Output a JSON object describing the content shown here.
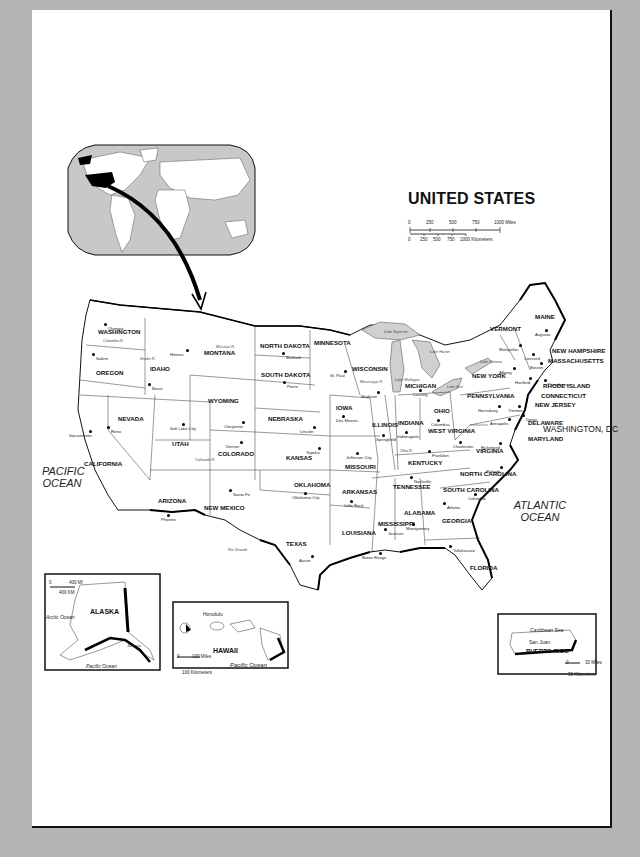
{
  "map": {
    "title": "UNITED STATES",
    "scale": {
      "miles_ticks": [
        "0",
        "250",
        "500",
        "750",
        "1000 Miles"
      ],
      "km_ticks": [
        "0",
        "250",
        "500",
        "750",
        "1000 Kilometers"
      ]
    },
    "oceans": {
      "pacific": "PACIFIC OCEAN",
      "atlantic": "ATLANTIC OCEAN"
    },
    "district": "WASHINGTON, DC",
    "states": [
      {
        "name": "WASHINGTON",
        "x": 98,
        "y": 329
      },
      {
        "name": "OREGON",
        "x": 96,
        "y": 370
      },
      {
        "name": "IDAHO",
        "x": 150,
        "y": 366
      },
      {
        "name": "MONTANA",
        "x": 204,
        "y": 350
      },
      {
        "name": "WYOMING",
        "x": 208,
        "y": 398
      },
      {
        "name": "NEVADA",
        "x": 118,
        "y": 416
      },
      {
        "name": "UTAH",
        "x": 172,
        "y": 441
      },
      {
        "name": "CALIFORNIA",
        "x": 84,
        "y": 461
      },
      {
        "name": "COLORADO",
        "x": 218,
        "y": 451
      },
      {
        "name": "ARIZONA",
        "x": 158,
        "y": 498
      },
      {
        "name": "NEW MEXICO",
        "x": 204,
        "y": 505
      },
      {
        "name": "NORTH DAKOTA",
        "x": 260,
        "y": 343
      },
      {
        "name": "SOUTH DAKOTA",
        "x": 261,
        "y": 372
      },
      {
        "name": "NEBRASKA",
        "x": 268,
        "y": 416
      },
      {
        "name": "KANSAS",
        "x": 286,
        "y": 455
      },
      {
        "name": "OKLAHOMA",
        "x": 294,
        "y": 482
      },
      {
        "name": "TEXAS",
        "x": 286,
        "y": 541
      },
      {
        "name": "MINNESOTA",
        "x": 314,
        "y": 340
      },
      {
        "name": "IOWA",
        "x": 336,
        "y": 405
      },
      {
        "name": "MISSOURI",
        "x": 345,
        "y": 464
      },
      {
        "name": "ARKANSAS",
        "x": 342,
        "y": 489
      },
      {
        "name": "LOUISIANA",
        "x": 342,
        "y": 530
      },
      {
        "name": "WISCONSIN",
        "x": 352,
        "y": 366
      },
      {
        "name": "ILLINOIS",
        "x": 372,
        "y": 422
      },
      {
        "name": "MICHIGAN",
        "x": 405,
        "y": 383
      },
      {
        "name": "INDIANA",
        "x": 398,
        "y": 420
      },
      {
        "name": "OHIO",
        "x": 434,
        "y": 408
      },
      {
        "name": "KENTUCKY",
        "x": 408,
        "y": 460
      },
      {
        "name": "TENNESSEE",
        "x": 393,
        "y": 484
      },
      {
        "name": "MISSISSIPPI",
        "x": 378,
        "y": 521
      },
      {
        "name": "ALABAMA",
        "x": 404,
        "y": 510
      },
      {
        "name": "GEORGIA",
        "x": 442,
        "y": 518
      },
      {
        "name": "FLORIDA",
        "x": 470,
        "y": 565
      },
      {
        "name": "SOUTH CAROLINA",
        "x": 443,
        "y": 487
      },
      {
        "name": "NORTH CAROLINA",
        "x": 460,
        "y": 471
      },
      {
        "name": "VIRGINIA",
        "x": 476,
        "y": 448
      },
      {
        "name": "WEST VIRGINIA",
        "x": 428,
        "y": 428
      },
      {
        "name": "PENNSYLVANIA",
        "x": 467,
        "y": 393
      },
      {
        "name": "NEW YORK",
        "x": 472,
        "y": 373
      },
      {
        "name": "VERMONT",
        "x": 490,
        "y": 326
      },
      {
        "name": "MAINE",
        "x": 535,
        "y": 314
      },
      {
        "name": "NEW HAMPSHIRE",
        "x": 552,
        "y": 348
      },
      {
        "name": "MASSACHUSETTS",
        "x": 548,
        "y": 358
      },
      {
        "name": "RHODE ISLAND",
        "x": 543,
        "y": 383
      },
      {
        "name": "CONNECTICUT",
        "x": 541,
        "y": 393
      },
      {
        "name": "NEW JERSEY",
        "x": 535,
        "y": 402
      },
      {
        "name": "DELAWARE",
        "x": 528,
        "y": 420
      },
      {
        "name": "MARYLAND",
        "x": 528,
        "y": 436
      }
    ],
    "capitals": [
      {
        "name": "Olympia",
        "x": 104,
        "y": 323,
        "dx": 4
      },
      {
        "name": "Salem",
        "x": 92,
        "y": 353,
        "dx": 4
      },
      {
        "name": "Boise",
        "x": 148,
        "y": 383,
        "dx": 4
      },
      {
        "name": "Helena",
        "x": 186,
        "y": 349,
        "dx": -16
      },
      {
        "name": "Bismark",
        "x": 282,
        "y": 352,
        "dx": 4
      },
      {
        "name": "Pierre",
        "x": 283,
        "y": 381,
        "dx": 4
      },
      {
        "name": "Cheyenne",
        "x": 242,
        "y": 421,
        "dx": -18
      },
      {
        "name": "Sacramento",
        "x": 89,
        "y": 430,
        "dx": -20
      },
      {
        "name": "Reno",
        "x": 107,
        "y": 426,
        "dx": 4
      },
      {
        "name": "Salt Lake City",
        "x": 182,
        "y": 423,
        "dx": -12
      },
      {
        "name": "Denver",
        "x": 240,
        "y": 441,
        "dx": -14
      },
      {
        "name": "Santa Fe",
        "x": 229,
        "y": 489,
        "dx": 4
      },
      {
        "name": "Phoenix",
        "x": 167,
        "y": 514,
        "dx": -6
      },
      {
        "name": "Lincoln",
        "x": 313,
        "y": 426,
        "dx": -13
      },
      {
        "name": "Topeka",
        "x": 318,
        "y": 447,
        "dx": -12
      },
      {
        "name": "Oklahoma City",
        "x": 304,
        "y": 492,
        "dx": -12
      },
      {
        "name": "Austin",
        "x": 311,
        "y": 555,
        "dx": -12
      },
      {
        "name": "St. Paul",
        "x": 344,
        "y": 370,
        "dx": -14
      },
      {
        "name": "Des Moines",
        "x": 342,
        "y": 415,
        "dx": -6
      },
      {
        "name": "Jefferson City",
        "x": 356,
        "y": 452,
        "dx": -10
      },
      {
        "name": "Little Rock",
        "x": 350,
        "y": 500,
        "dx": -6
      },
      {
        "name": "Baton Rouge",
        "x": 379,
        "y": 552,
        "dx": -17
      },
      {
        "name": "Jackson",
        "x": 384,
        "y": 528,
        "dx": 0
      },
      {
        "name": "Madison",
        "x": 377,
        "y": 391,
        "dx": -16
      },
      {
        "name": "Lansing",
        "x": 419,
        "y": 389,
        "dx": -6
      },
      {
        "name": "Springfield",
        "x": 382,
        "y": 434,
        "dx": -6
      },
      {
        "name": "Indianapolis",
        "x": 405,
        "y": 431,
        "dx": -8
      },
      {
        "name": "Columbus",
        "x": 437,
        "y": 419,
        "dx": -6
      },
      {
        "name": "Frankfort",
        "x": 428,
        "y": 450,
        "dx": 4
      },
      {
        "name": "Nashville",
        "x": 410,
        "y": 476,
        "dx": 4
      },
      {
        "name": "Montgomery",
        "x": 412,
        "y": 523,
        "dx": -6
      },
      {
        "name": "Atlanta",
        "x": 443,
        "y": 502,
        "dx": 4
      },
      {
        "name": "Tallahassee",
        "x": 449,
        "y": 545,
        "dx": 4
      },
      {
        "name": "Columbia",
        "x": 474,
        "y": 493,
        "dx": -6
      },
      {
        "name": "Raleigh",
        "x": 500,
        "y": 466,
        "dx": -14
      },
      {
        "name": "Richmond",
        "x": 499,
        "y": 442,
        "dx": -18
      },
      {
        "name": "Charleston",
        "x": 459,
        "y": 441,
        "dx": -6
      },
      {
        "name": "Harrisburg",
        "x": 498,
        "y": 405,
        "dx": -20
      },
      {
        "name": "Trenton",
        "x": 518,
        "y": 405,
        "dx": -10
      },
      {
        "name": "Dover",
        "x": 522,
        "y": 414,
        "dx": 4
      },
      {
        "name": "Annapolis",
        "x": 508,
        "y": 418,
        "dx": -18
      },
      {
        "name": "Albany",
        "x": 513,
        "y": 367,
        "dx": -14
      },
      {
        "name": "Hartford",
        "x": 529,
        "y": 377,
        "dx": -14
      },
      {
        "name": "Providence",
        "x": 544,
        "y": 379,
        "dx": 4
      },
      {
        "name": "Boston",
        "x": 540,
        "y": 362,
        "dx": -10
      },
      {
        "name": "Concord",
        "x": 532,
        "y": 353,
        "dx": -8
      },
      {
        "name": "Montpelier",
        "x": 519,
        "y": 344,
        "dx": -20
      },
      {
        "name": "Augusta",
        "x": 545,
        "y": 329,
        "dx": -10
      }
    ],
    "rivers": [
      {
        "name": "Columbia R.",
        "x": 103,
        "y": 339
      },
      {
        "name": "Snake R.",
        "x": 140,
        "y": 357
      },
      {
        "name": "Missouri R.",
        "x": 216,
        "y": 345
      },
      {
        "name": "Mississippi R.",
        "x": 360,
        "y": 380
      },
      {
        "name": "Colorado R.",
        "x": 195,
        "y": 458
      },
      {
        "name": "Rio Grande",
        "x": 228,
        "y": 548
      },
      {
        "name": "Ohio R.",
        "x": 400,
        "y": 449
      }
    ],
    "lakes": [
      {
        "name": "Lake Superior",
        "x": 384,
        "y": 330
      },
      {
        "name": "Lake Michigan",
        "x": 395,
        "y": 378
      },
      {
        "name": "Lake Huron",
        "x": 430,
        "y": 350
      },
      {
        "name": "Lake Erie",
        "x": 447,
        "y": 385
      },
      {
        "name": "Lake Ontario",
        "x": 480,
        "y": 360
      }
    ]
  },
  "insets": {
    "alaska": {
      "title": "ALASKA",
      "capital": "Juneau",
      "scale_miles": "400 MI",
      "scale_km": "400 KM",
      "scale_zero": "0",
      "ocean_arctic": "Arctic Ocean",
      "ocean_pacific": "Pacific Ocean"
    },
    "hawaii": {
      "title": "HAWAII",
      "capital": "Honolulu",
      "scale_miles": "100 Miles",
      "scale_km": "100 Kilometers",
      "scale_zero": "0",
      "ocean": "Pacific Ocean"
    },
    "puerto_rico": {
      "title": "PUERTO RICO",
      "capital": "San Juan",
      "sea": "Caribbean Sea",
      "scale_miles": "30 Miles",
      "scale_km": "30 Kilometers",
      "scale_zero": "0"
    }
  },
  "colors": {
    "background": "#b4b4b4",
    "page": "#ffffff",
    "land": "#ffffff",
    "water_world": "#c8c8c8",
    "lakes": "#d0d0d0",
    "highlight": "#000000"
  }
}
